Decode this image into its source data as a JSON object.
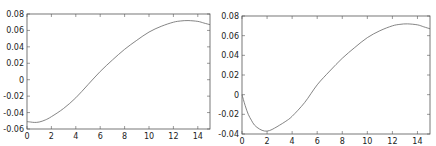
{
  "chart_data": [
    {
      "type": "line",
      "title": "",
      "xlabel": "",
      "ylabel": "",
      "xlim": [
        0,
        15
      ],
      "ylim": [
        -0.06,
        0.08
      ],
      "grid": false,
      "xticks": [
        0,
        2,
        4,
        6,
        8,
        10,
        12,
        14
      ],
      "xtick_labels": [
        "0",
        "2",
        "4",
        "6",
        "8",
        "10",
        "12",
        "14"
      ],
      "yticks": [
        -0.06,
        -0.04,
        -0.02,
        0,
        0.02,
        0.04,
        0.06,
        0.08
      ],
      "ytick_labels": [
        "-0.06",
        "-0.04",
        "-0.02",
        "0",
        "0.02",
        "0.04",
        "0.06",
        "0.08"
      ],
      "series": [
        {
          "name": "curve",
          "color": "#666666",
          "x": [
            0,
            0.3,
            0.6,
            1,
            1.5,
            2,
            3,
            4,
            5,
            6,
            7,
            8,
            9,
            10,
            11,
            12,
            12.6,
            13.2,
            14,
            14.5,
            15
          ],
          "y": [
            -0.051,
            -0.0515,
            -0.052,
            -0.0515,
            -0.049,
            -0.045,
            -0.035,
            -0.022,
            -0.006,
            0.01,
            0.024,
            0.037,
            0.048,
            0.058,
            0.065,
            0.07,
            0.0715,
            0.072,
            0.071,
            0.069,
            0.067
          ]
        }
      ]
    },
    {
      "type": "line",
      "title": "",
      "xlabel": "",
      "ylabel": "",
      "xlim": [
        0,
        15
      ],
      "ylim": [
        -0.04,
        0.08
      ],
      "grid": false,
      "xticks": [
        0,
        2,
        4,
        6,
        8,
        10,
        12,
        14
      ],
      "xtick_labels": [
        "0",
        "2",
        "4",
        "6",
        "8",
        "10",
        "12",
        "14"
      ],
      "yticks": [
        -0.04,
        -0.02,
        0,
        0.02,
        0.04,
        0.06,
        0.08
      ],
      "ytick_labels": [
        "-0.04",
        "-0.02",
        "0",
        "0.02",
        "0.04",
        "0.06",
        "0.08"
      ],
      "series": [
        {
          "name": "curve",
          "color": "#666666",
          "x": [
            0,
            0.25,
            0.5,
            0.75,
            1,
            1.4,
            1.8,
            2.2,
            2.6,
            3,
            3.5,
            4,
            5,
            6,
            7,
            8,
            9,
            10,
            11,
            12,
            12.6,
            13.2,
            14,
            14.5,
            15
          ],
          "y": [
            0.0,
            -0.011,
            -0.02,
            -0.026,
            -0.031,
            -0.035,
            -0.037,
            -0.0365,
            -0.034,
            -0.031,
            -0.027,
            -0.022,
            -0.008,
            0.01,
            0.024,
            0.037,
            0.048,
            0.058,
            0.065,
            0.07,
            0.0715,
            0.072,
            0.071,
            0.069,
            0.067
          ]
        }
      ]
    }
  ]
}
